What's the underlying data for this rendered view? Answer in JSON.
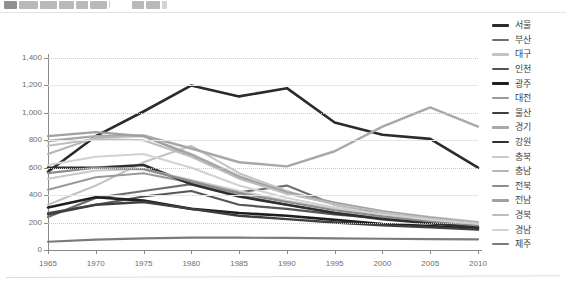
{
  "toolbar": {
    "groups": [
      {
        "name": "menu-group",
        "buttons": [
          "grid-icon",
          "block-a-icon",
          "block-b-icon",
          "block-c-icon",
          "block-d-icon",
          "block-e-icon"
        ]
      },
      {
        "name": "tool-group",
        "buttons": [
          "tool-a-icon",
          "tool-b-icon",
          "tool-c-icon"
        ]
      }
    ]
  },
  "chart_data": {
    "type": "line",
    "title": "",
    "subtitle": "",
    "xlabel": "",
    "ylabel": "",
    "xlim": [
      1965,
      2010
    ],
    "ylim": [
      0,
      1400
    ],
    "ytick_step": 200,
    "grid": true,
    "legend_position": "right",
    "x": [
      1965,
      1970,
      1975,
      1980,
      1985,
      1990,
      1995,
      2000,
      2005,
      2010
    ],
    "xticks": [
      "1965",
      "1970",
      "1975",
      "1980",
      "1985",
      "1990",
      "1995",
      "2000",
      "2005",
      "2010"
    ],
    "yticks": [
      "0",
      "200",
      "400",
      "600",
      "800",
      "1,000",
      "1,200",
      "1,400"
    ],
    "series": [
      {
        "name": "서울",
        "color": "#2b2b2b",
        "width": 2.6,
        "values": [
          570,
          830,
          1010,
          1200,
          1120,
          1180,
          930,
          840,
          810,
          600
        ]
      },
      {
        "name": "부산",
        "color": "#6f6f6f",
        "width": 2.2,
        "values": [
          240,
          380,
          430,
          480,
          420,
          470,
          330,
          260,
          215,
          150
        ]
      },
      {
        "name": "대구",
        "color": "#c3c3c3",
        "width": 2.0,
        "values": [
          330,
          470,
          640,
          760,
          560,
          430,
          330,
          250,
          200,
          170
        ]
      },
      {
        "name": "인천",
        "color": "#555555",
        "width": 2.2,
        "values": [
          270,
          330,
          390,
          430,
          330,
          300,
          260,
          230,
          200,
          170
        ]
      },
      {
        "name": "광주",
        "color": "#1f1f1f",
        "width": 2.6,
        "values": [
          310,
          385,
          360,
          300,
          270,
          250,
          220,
          190,
          175,
          155
        ]
      },
      {
        "name": "대전",
        "color": "#9a9a9a",
        "width": 2.0,
        "values": [
          440,
          530,
          560,
          490,
          400,
          330,
          275,
          230,
          205,
          180
        ]
      },
      {
        "name": "울산",
        "color": "#3f3f3f",
        "width": 2.4,
        "values": [
          260,
          330,
          350,
          300,
          250,
          225,
          200,
          180,
          165,
          150
        ]
      },
      {
        "name": "경기",
        "color": "#a8a8a8",
        "width": 2.4,
        "values": [
          795,
          830,
          835,
          740,
          640,
          610,
          720,
          900,
          1040,
          900
        ]
      },
      {
        "name": "강원",
        "color": "#2f2f2f",
        "width": 2.6,
        "values": [
          600,
          600,
          620,
          480,
          390,
          330,
          270,
          225,
          195,
          165
        ]
      },
      {
        "name": "충북",
        "color": "#c9c9c9",
        "width": 2.0,
        "values": [
          520,
          580,
          590,
          510,
          430,
          360,
          300,
          250,
          215,
          185
        ]
      },
      {
        "name": "충남",
        "color": "#b5b5b5",
        "width": 2.0,
        "values": [
          700,
          820,
          830,
          700,
          540,
          420,
          345,
          285,
          240,
          205
        ]
      },
      {
        "name": "전북",
        "color": "#8c8c8c",
        "width": 2.2,
        "values": [
          560,
          600,
          590,
          500,
          415,
          350,
          290,
          245,
          210,
          180
        ]
      },
      {
        "name": "전남",
        "color": "#a0a0a0",
        "width": 2.2,
        "values": [
          830,
          860,
          830,
          690,
          530,
          420,
          345,
          280,
          235,
          195
        ]
      },
      {
        "name": "경북",
        "color": "#bdbdbd",
        "width": 2.0,
        "values": [
          760,
          810,
          800,
          680,
          520,
          410,
          335,
          275,
          230,
          195
        ]
      },
      {
        "name": "경남",
        "color": "#d2d2d2",
        "width": 2.0,
        "values": [
          620,
          680,
          700,
          600,
          470,
          380,
          310,
          260,
          220,
          190
        ]
      },
      {
        "name": "제주",
        "color": "#7a7a7a",
        "width": 2.2,
        "values": [
          60,
          75,
          85,
          90,
          90,
          88,
          85,
          82,
          80,
          78
        ]
      }
    ]
  }
}
